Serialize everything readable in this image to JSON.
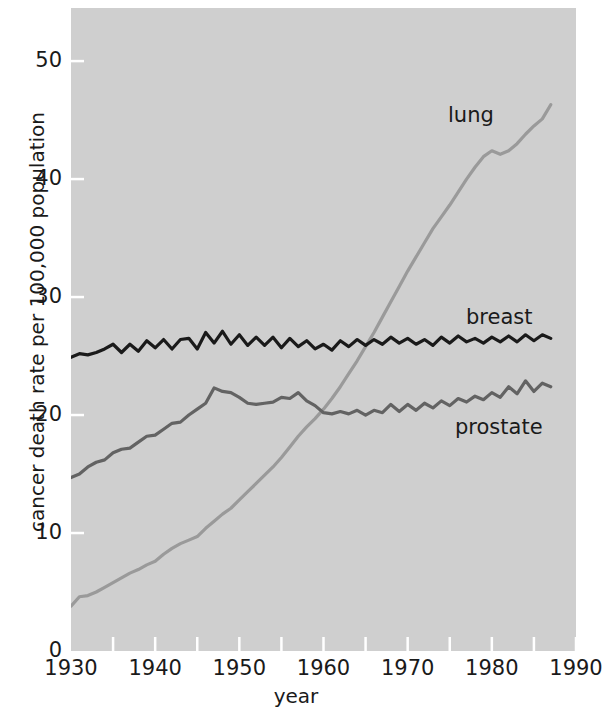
{
  "chart_data": {
    "type": "line",
    "title": "",
    "subtitle": "",
    "xlabel": "year",
    "ylabel": "cancer death rate per 100,000 population",
    "xlim": [
      1930,
      1990
    ],
    "ylim": [
      0,
      54.5
    ],
    "grid": false,
    "legend_position": "inline-annotations",
    "background_color": "#cfcfcf",
    "x_ticks_major": [
      1930,
      1940,
      1950,
      1960,
      1970,
      1980,
      1990
    ],
    "x_tick_labels": [
      "1930",
      "1940",
      "1950",
      "1960",
      "1970",
      "1980",
      "1990"
    ],
    "x_ticks_minor": [
      1935,
      1945,
      1955,
      1965,
      1975,
      1985
    ],
    "y_ticks": [
      0,
      10,
      20,
      30,
      40,
      50
    ],
    "y_tick_labels": [
      "0",
      "10",
      "20",
      "30",
      "40",
      "50"
    ],
    "series": [
      {
        "name": "lung",
        "color": "#9a9a9a",
        "label_text": "lung",
        "x": [
          1930,
          1931,
          1932,
          1933,
          1934,
          1935,
          1936,
          1937,
          1938,
          1939,
          1940,
          1941,
          1942,
          1943,
          1944,
          1945,
          1946,
          1947,
          1948,
          1949,
          1950,
          1951,
          1952,
          1953,
          1954,
          1955,
          1956,
          1957,
          1958,
          1959,
          1960,
          1961,
          1962,
          1963,
          1964,
          1965,
          1966,
          1967,
          1968,
          1969,
          1970,
          1971,
          1972,
          1973,
          1974,
          1975,
          1976,
          1977,
          1978,
          1979,
          1980,
          1981,
          1982,
          1983,
          1984,
          1985,
          1986,
          1987
        ],
        "values": [
          3.8,
          4.6,
          4.7,
          5.0,
          5.4,
          5.8,
          6.2,
          6.6,
          6.9,
          7.3,
          7.6,
          8.2,
          8.7,
          9.1,
          9.4,
          9.7,
          10.4,
          11.0,
          11.6,
          12.1,
          12.8,
          13.5,
          14.2,
          14.9,
          15.6,
          16.4,
          17.3,
          18.2,
          19.0,
          19.7,
          20.5,
          21.4,
          22.4,
          23.5,
          24.6,
          25.8,
          27.0,
          28.3,
          29.6,
          30.9,
          32.2,
          33.4,
          34.6,
          35.8,
          36.8,
          37.8,
          38.9,
          40.0,
          41.0,
          41.9,
          42.4,
          42.1,
          42.4,
          43.0,
          43.8,
          44.5,
          45.1,
          46.3
        ]
      },
      {
        "name": "breast",
        "color": "#1a1a1a",
        "label_text": "breast",
        "x": [
          1930,
          1931,
          1932,
          1933,
          1934,
          1935,
          1936,
          1937,
          1938,
          1939,
          1940,
          1941,
          1942,
          1943,
          1944,
          1945,
          1946,
          1947,
          1948,
          1949,
          1950,
          1951,
          1952,
          1953,
          1954,
          1955,
          1956,
          1957,
          1958,
          1959,
          1960,
          1961,
          1962,
          1963,
          1964,
          1965,
          1966,
          1967,
          1968,
          1969,
          1970,
          1971,
          1972,
          1973,
          1974,
          1975,
          1976,
          1977,
          1978,
          1979,
          1980,
          1981,
          1982,
          1983,
          1984,
          1985,
          1986,
          1987
        ],
        "values": [
          24.9,
          25.2,
          25.1,
          25.3,
          25.6,
          26.0,
          25.3,
          26.0,
          25.4,
          26.3,
          25.7,
          26.4,
          25.6,
          26.4,
          26.5,
          25.6,
          27.0,
          26.1,
          27.1,
          26.0,
          26.8,
          25.9,
          26.6,
          25.9,
          26.6,
          25.7,
          26.5,
          25.8,
          26.3,
          25.6,
          26.0,
          25.5,
          26.3,
          25.8,
          26.4,
          25.9,
          26.4,
          26.0,
          26.6,
          26.1,
          26.5,
          26.0,
          26.4,
          25.9,
          26.6,
          26.1,
          26.7,
          26.2,
          26.5,
          26.1,
          26.6,
          26.2,
          26.7,
          26.2,
          26.8,
          26.3,
          26.8,
          26.5
        ]
      },
      {
        "name": "prostate",
        "color": "#636363",
        "label_text": "prostate",
        "x": [
          1930,
          1931,
          1932,
          1933,
          1934,
          1935,
          1936,
          1937,
          1938,
          1939,
          1940,
          1941,
          1942,
          1943,
          1944,
          1945,
          1946,
          1947,
          1948,
          1949,
          1950,
          1951,
          1952,
          1953,
          1954,
          1955,
          1956,
          1957,
          1958,
          1959,
          1960,
          1961,
          1962,
          1963,
          1964,
          1965,
          1966,
          1967,
          1968,
          1969,
          1970,
          1971,
          1972,
          1973,
          1974,
          1975,
          1976,
          1977,
          1978,
          1979,
          1980,
          1981,
          1982,
          1983,
          1984,
          1985,
          1986,
          1987
        ],
        "values": [
          14.7,
          15.0,
          15.6,
          16.0,
          16.2,
          16.8,
          17.1,
          17.2,
          17.7,
          18.2,
          18.3,
          18.8,
          19.3,
          19.4,
          20.0,
          20.5,
          21.0,
          22.3,
          22.0,
          21.9,
          21.5,
          21.0,
          20.9,
          21.0,
          21.1,
          21.5,
          21.4,
          21.9,
          21.2,
          20.8,
          20.2,
          20.1,
          20.3,
          20.1,
          20.4,
          20.0,
          20.4,
          20.2,
          20.9,
          20.3,
          20.9,
          20.4,
          21.0,
          20.6,
          21.2,
          20.8,
          21.4,
          21.1,
          21.6,
          21.3,
          21.9,
          21.5,
          22.4,
          21.8,
          22.9,
          22.0,
          22.7,
          22.4
        ]
      }
    ]
  },
  "axes": {
    "x_title": "year",
    "y_title": "cancer death rate per 100,000 population"
  }
}
